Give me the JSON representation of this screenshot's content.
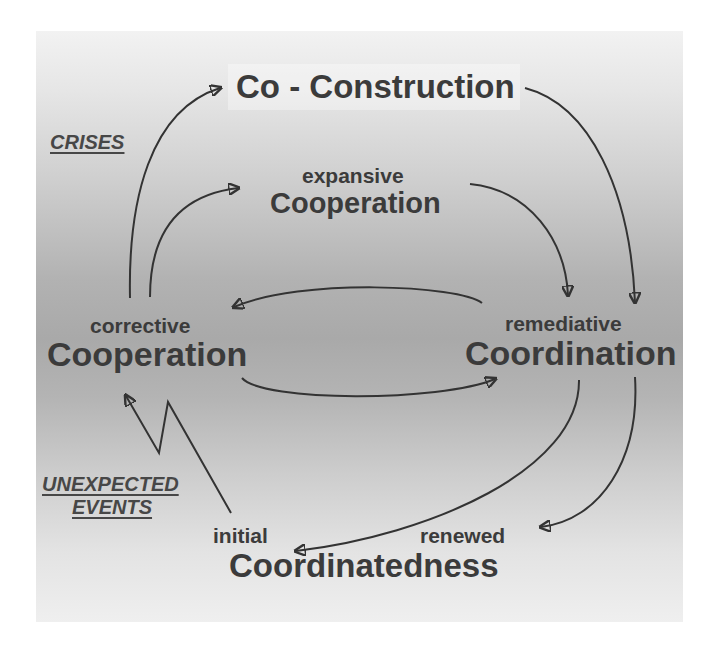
{
  "diagram": {
    "title": "Co - Construction",
    "nodes": {
      "top": {
        "main": "Co - Construction"
      },
      "expansive": {
        "qualifier": "expansive",
        "main": "Cooperation"
      },
      "corrective": {
        "qualifier": "corrective",
        "main": "Cooperation"
      },
      "remediative": {
        "qualifier": "remediative",
        "main": "Coordination"
      },
      "bottom": {
        "qualifier_left": "initial",
        "qualifier_right": "renewed",
        "main": "Coordinatedness"
      }
    },
    "side_labels": {
      "crises": "CRISES",
      "unexpected_line1": "UNEXPECTED",
      "unexpected_line2": "EVENTS"
    },
    "edges": [
      {
        "from": "corrective Cooperation",
        "to": "Co - Construction"
      },
      {
        "from": "corrective Cooperation",
        "to": "expansive Cooperation"
      },
      {
        "from": "Co - Construction",
        "to": "remediative Coordination"
      },
      {
        "from": "expansive Cooperation",
        "to": "remediative Coordination"
      },
      {
        "from": "remediative Coordination",
        "to": "corrective Cooperation"
      },
      {
        "from": "corrective Cooperation",
        "to": "remediative Coordination"
      },
      {
        "from": "remediative Coordination",
        "to": "initial Coordinatedness"
      },
      {
        "from": "remediative Coordination",
        "to": "renewed Coordinatedness"
      },
      {
        "from": "initial Coordinatedness",
        "to": "corrective Cooperation",
        "style": "zigzag"
      }
    ],
    "colors": {
      "text": "#3b3b3b",
      "arrow": "#333333",
      "background_light": "#f2f2f2",
      "background_dark": "#a9a9a9"
    }
  }
}
